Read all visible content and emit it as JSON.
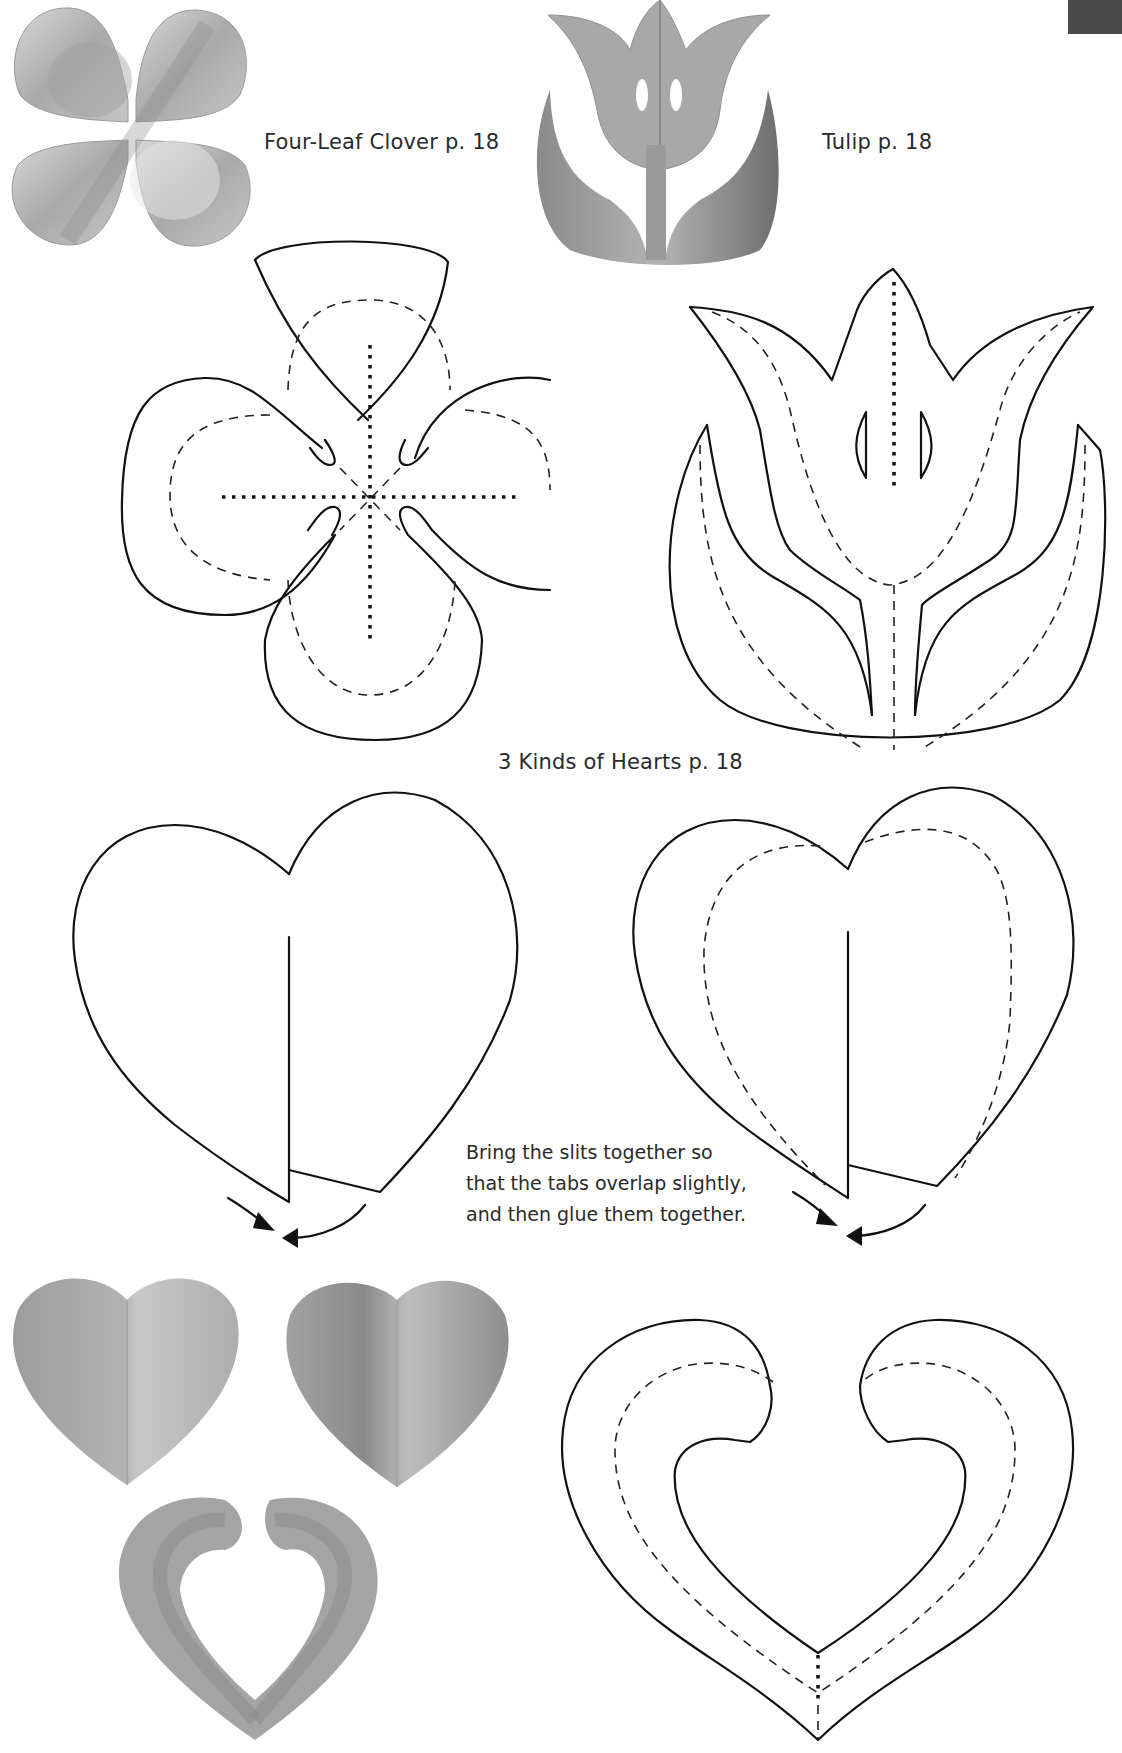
{
  "page": {
    "tab_color": "#4a4a4a"
  },
  "captions": {
    "clover": "Four-Leaf Clover  p. 18",
    "tulip": "Tulip  p. 18",
    "hearts": "3 Kinds of Hearts  p. 18"
  },
  "instructions": {
    "lines": [
      "Bring the slits together so",
      "that the tabs overlap slightly,",
      "and then glue them together."
    ]
  },
  "photos": [
    {
      "name": "four-leaf-clover-photo"
    },
    {
      "name": "tulip-photo"
    },
    {
      "name": "heart-photo-1"
    },
    {
      "name": "heart-photo-2"
    },
    {
      "name": "heart-photo-3-open"
    }
  ],
  "patterns": [
    {
      "name": "four-leaf-clover-pattern"
    },
    {
      "name": "tulip-pattern"
    },
    {
      "name": "heart-pattern-slit"
    },
    {
      "name": "heart-pattern-slit-folded"
    },
    {
      "name": "heart-pattern-open"
    }
  ],
  "legend": {
    "cut_line": "solid",
    "valley_fold": "dashed",
    "mountain_fold": "dotted"
  }
}
